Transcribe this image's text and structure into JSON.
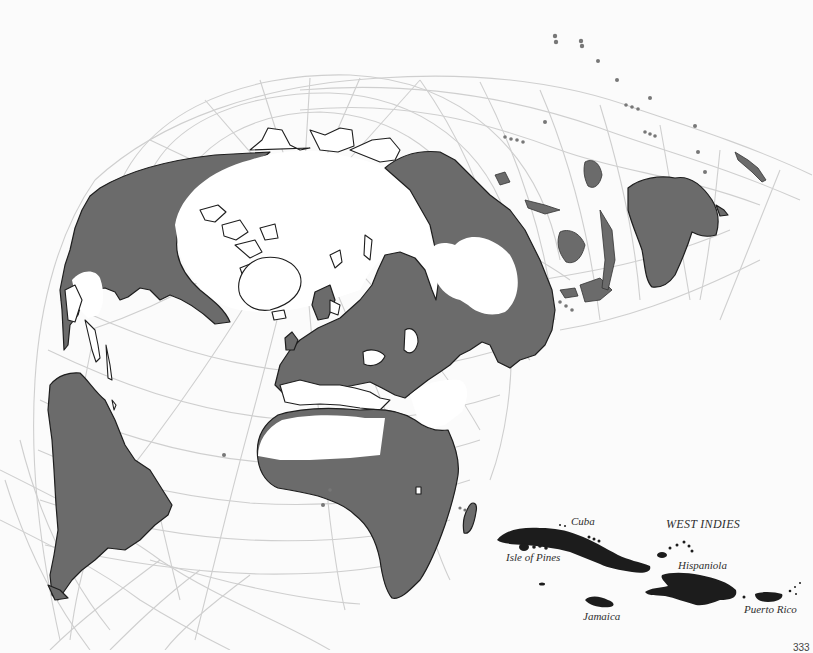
{
  "map": {
    "type": "world projection (polar-centered interrupted) with inset",
    "colors": {
      "background": "#fbfbfb",
      "land_shaded": "#6b6b6b",
      "land_unshaded": "#ffffff",
      "coastline": "#1e1e1e",
      "graticule": "#cfcfcf",
      "inset_islands": "#1c1c1c",
      "label_text": "#2e2e2e"
    },
    "inset": {
      "title": "WEST INDIES",
      "labels": {
        "cuba": "Cuba",
        "isle_of_pines": "Isle of Pines",
        "hispaniola": "Hispaniola",
        "jamaica": "Jamaica",
        "puerto_rico": "Puerto Rico"
      }
    },
    "page_number": "333"
  }
}
